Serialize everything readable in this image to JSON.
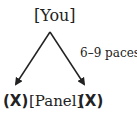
{
  "top_label": "[You]",
  "distance_label": "6–9 paces",
  "bottom": {
    "left_marker": "(X)",
    "center_label": "[Panel]",
    "right_marker": "(X)"
  }
}
